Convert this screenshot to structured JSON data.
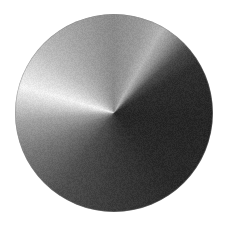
{
  "image": {
    "title": "Conic (angular) grayscale gradient disc",
    "width": 226,
    "height": 228,
    "background_color": "#ffffff",
    "noise": {
      "enabled": true,
      "description": "film-grain speckle over the disc",
      "amplitude": 14,
      "cell": 1
    }
  },
  "disc": {
    "label": "gradient-disc",
    "center_x": 114,
    "center_y": 113,
    "radius": 99,
    "diameter": 198,
    "edge_softness_px": 1.2,
    "gradient": {
      "type": "conic",
      "units": "degrees clockwise from north (12 o'clock)",
      "stops": [
        {
          "angle": 0,
          "color": "#8a8a8a",
          "note": "north / top — mid gray"
        },
        {
          "angle": 18,
          "color": "#9a9a9a",
          "note": "slight lift toward NNE"
        },
        {
          "angle": 30,
          "color": "#b4b4b4",
          "note": "bright streak NNE"
        },
        {
          "angle": 38,
          "color": "#8f8f8f",
          "note": "streak falls off"
        },
        {
          "angle": 48,
          "color": "#4a4a4a",
          "note": "sharp drop to shadow"
        },
        {
          "angle": 60,
          "color": "#2e2e2e",
          "note": "ENE dark"
        },
        {
          "angle": 95,
          "color": "#262626",
          "note": "east — near black"
        },
        {
          "angle": 140,
          "color": "#2a2a2a",
          "note": "ESE / SE dark plateau"
        },
        {
          "angle": 180,
          "color": "#3a3a3a",
          "note": "south — dark gray"
        },
        {
          "angle": 215,
          "color": "#4e4e4e",
          "note": "SSW lightening"
        },
        {
          "angle": 245,
          "color": "#777777",
          "note": "SW mid gray"
        },
        {
          "angle": 265,
          "color": "#a2a2a2",
          "note": "WSW light"
        },
        {
          "angle": 278,
          "color": "#d8d8d8",
          "note": "near-white band"
        },
        {
          "angle": 286,
          "color": "#f2f2f2",
          "note": "brightest — west"
        },
        {
          "angle": 295,
          "color": "#dedede",
          "note": "falling from peak"
        },
        {
          "angle": 310,
          "color": "#bfbfbf",
          "note": "WNW"
        },
        {
          "angle": 330,
          "color": "#a6a6a6",
          "note": "NW"
        },
        {
          "angle": 352,
          "color": "#909090",
          "note": "NNW back to mid"
        },
        {
          "angle": 360,
          "color": "#8a8a8a",
          "note": "wrap to north"
        }
      ]
    }
  },
  "accessibility": {
    "alt_text": "A circular disc filled with a smooth angular grayscale gradient, brightest near the left side and darkest on the right, over a white background."
  }
}
